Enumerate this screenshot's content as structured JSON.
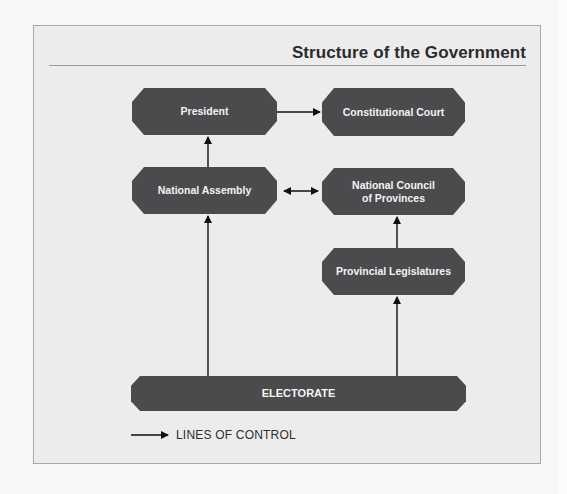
{
  "diagram": {
    "title": "Structure of the Government",
    "nodes": {
      "president": "President",
      "constitutional_court": "Constitutional Court",
      "national_assembly": "National Assembly",
      "ncop_line1": "National Council",
      "ncop_line2": "of Provinces",
      "provincial_legislatures": "Provincial Legislatures",
      "electorate": "ELECTORATE"
    },
    "edges": [
      {
        "from": "President",
        "to": "Constitutional Court",
        "type": "one-way"
      },
      {
        "from": "National Assembly",
        "to": "President",
        "type": "one-way"
      },
      {
        "from": "National Assembly",
        "to": "National Council of Provinces",
        "type": "two-way"
      },
      {
        "from": "Provincial Legislatures",
        "to": "National Council of Provinces",
        "type": "one-way"
      },
      {
        "from": "Electorate",
        "to": "National Assembly",
        "type": "one-way"
      },
      {
        "from": "Electorate",
        "to": "Provincial Legislatures",
        "type": "one-way"
      }
    ],
    "legend": {
      "label": "LINES OF CONTROL",
      "icon": "right-arrow-icon"
    },
    "colors": {
      "node_fill": "#4b4b4d",
      "node_text": "#f4f4f4",
      "background": "#ececec",
      "line": "#111111"
    }
  }
}
